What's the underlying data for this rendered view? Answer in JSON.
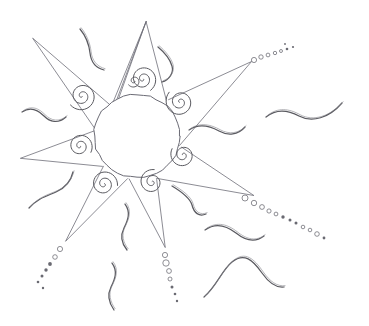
{
  "artwork": {
    "title": "Hand-drawn sun with rays, spirals and squiggles",
    "medium": "pencil sketch",
    "canvas": {
      "width": 369,
      "height": 326,
      "background": "#ffffff"
    },
    "palette": {
      "line": "#6e6e78",
      "spiral": "#59595f",
      "squiggle": "#5a5a60",
      "dot": "#6a6a72",
      "background": "#ffffff"
    }
  },
  "core": {
    "label": "sun-core",
    "cx": 137,
    "cy": 136,
    "r": 43,
    "stroke": "#6b6b75"
  },
  "rays": [
    {
      "name": "ray-north",
      "tip_x": 146,
      "tip_y": 21,
      "base_a_x": 117,
      "base_a_y": 103,
      "base_b_x": 166,
      "base_b_y": 100,
      "has_trail": false
    },
    {
      "name": "ray-northeast",
      "tip_x": 252,
      "tip_y": 61,
      "base_a_x": 168,
      "base_a_y": 99,
      "base_b_x": 180,
      "base_b_y": 146,
      "has_trail": true
    },
    {
      "name": "ray-east",
      "tip_x": 254,
      "tip_y": 196,
      "base_a_x": 181,
      "base_a_y": 148,
      "base_b_x": 157,
      "base_b_y": 178,
      "has_trail": true
    },
    {
      "name": "ray-south",
      "tip_x": 165,
      "tip_y": 248,
      "base_a_x": 156,
      "base_a_y": 179,
      "base_b_x": 129,
      "base_b_y": 179,
      "has_trail": true
    },
    {
      "name": "ray-southwest",
      "tip_x": 66,
      "tip_y": 241,
      "base_a_x": 128,
      "base_a_y": 178,
      "base_b_x": 104,
      "base_b_y": 167,
      "has_trail": true
    },
    {
      "name": "ray-west",
      "tip_x": 20,
      "tip_y": 158,
      "base_a_x": 102,
      "base_a_y": 166,
      "base_b_x": 95,
      "base_b_y": 130,
      "has_trail": false
    },
    {
      "name": "ray-northwest",
      "tip_x": 33,
      "tip_y": 38,
      "base_a_x": 95,
      "base_a_y": 128,
      "base_b_x": 110,
      "base_b_y": 105,
      "has_trail": false
    },
    {
      "name": "ray-north-left",
      "tip_x": 146,
      "tip_y": 21,
      "base_a_x": 112,
      "base_a_y": 104,
      "base_b_x": 116,
      "base_b_y": 103,
      "has_trail": false
    }
  ],
  "spirals": [
    {
      "name": "spiral-ray-north",
      "cx": 143,
      "cy": 79,
      "r": 13,
      "turns": 2.1,
      "rotation": 20
    },
    {
      "name": "spiral-ray-northeast",
      "cx": 180,
      "cy": 102,
      "r": 14,
      "turns": 2.2,
      "rotation": 150
    },
    {
      "name": "spiral-ray-east",
      "cx": 183,
      "cy": 155,
      "r": 12,
      "turns": 2.0,
      "rotation": 210
    },
    {
      "name": "spiral-ray-south",
      "cx": 152,
      "cy": 182,
      "r": 12,
      "turns": 2.0,
      "rotation": 280
    },
    {
      "name": "spiral-ray-southwest",
      "cx": 104,
      "cy": 184,
      "r": 13,
      "turns": 2.1,
      "rotation": 330
    },
    {
      "name": "spiral-ray-west",
      "cx": 80,
      "cy": 146,
      "r": 12,
      "turns": 2.0,
      "rotation": 30
    },
    {
      "name": "spiral-ray-northwest",
      "cx": 82,
      "cy": 96,
      "r": 14,
      "turns": 2.2,
      "rotation": 70
    },
    {
      "name": "spiral-ray-upper",
      "cx": 134,
      "cy": 81,
      "r": 6,
      "turns": 1.4,
      "rotation": 0
    }
  ],
  "trails": [
    {
      "name": "trail-northeast",
      "from_ray": "ray-northeast",
      "dots": [
        {
          "x": 254,
          "y": 60,
          "r": 2.6,
          "filled": false
        },
        {
          "x": 261,
          "y": 57,
          "r": 2.2,
          "filled": false
        },
        {
          "x": 268,
          "y": 55,
          "r": 1.9,
          "filled": false
        },
        {
          "x": 275,
          "y": 53,
          "r": 1.7,
          "filled": false
        },
        {
          "x": 281,
          "y": 51,
          "r": 1.5,
          "filled": false
        },
        {
          "x": 287,
          "y": 49,
          "r": 1.3,
          "filled": true
        },
        {
          "x": 293,
          "y": 47,
          "r": 1.1,
          "filled": true
        },
        {
          "x": 285,
          "y": 44,
          "r": 0.9,
          "filled": true
        }
      ]
    },
    {
      "name": "trail-east",
      "from_ray": "ray-east",
      "dots": [
        {
          "x": 245,
          "y": 198,
          "r": 3.0,
          "filled": false
        },
        {
          "x": 254,
          "y": 203,
          "r": 2.7,
          "filled": false
        },
        {
          "x": 262,
          "y": 207,
          "r": 2.4,
          "filled": false
        },
        {
          "x": 269,
          "y": 211,
          "r": 2.1,
          "filled": false
        },
        {
          "x": 276,
          "y": 214,
          "r": 1.9,
          "filled": false
        },
        {
          "x": 283,
          "y": 217,
          "r": 1.7,
          "filled": true
        },
        {
          "x": 290,
          "y": 220,
          "r": 1.5,
          "filled": true
        },
        {
          "x": 296,
          "y": 223,
          "r": 1.5,
          "filled": true
        },
        {
          "x": 303,
          "y": 227,
          "r": 1.8,
          "filled": false
        },
        {
          "x": 310,
          "y": 230,
          "r": 1.8,
          "filled": false
        },
        {
          "x": 317,
          "y": 234,
          "r": 2.3,
          "filled": false
        },
        {
          "x": 324,
          "y": 238,
          "r": 1.4,
          "filled": true
        }
      ]
    },
    {
      "name": "trail-south",
      "from_ray": "ray-south",
      "dots": [
        {
          "x": 165,
          "y": 255,
          "r": 2.6,
          "filled": false
        },
        {
          "x": 166,
          "y": 263,
          "r": 3.2,
          "filled": false
        },
        {
          "x": 169,
          "y": 271,
          "r": 2.4,
          "filled": false
        },
        {
          "x": 170,
          "y": 279,
          "r": 2.0,
          "filled": false
        },
        {
          "x": 172,
          "y": 287,
          "r": 1.5,
          "filled": true
        },
        {
          "x": 175,
          "y": 294,
          "r": 1.3,
          "filled": true
        },
        {
          "x": 177,
          "y": 301,
          "r": 1.2,
          "filled": true
        }
      ]
    },
    {
      "name": "trail-southwest",
      "from_ray": "ray-southwest",
      "dots": [
        {
          "x": 60,
          "y": 249,
          "r": 2.6,
          "filled": false
        },
        {
          "x": 55,
          "y": 257,
          "r": 2.3,
          "filled": false
        },
        {
          "x": 50,
          "y": 264,
          "r": 1.9,
          "filled": true
        },
        {
          "x": 46,
          "y": 270,
          "r": 1.7,
          "filled": true
        },
        {
          "x": 42,
          "y": 276,
          "r": 1.5,
          "filled": true
        },
        {
          "x": 38,
          "y": 282,
          "r": 1.3,
          "filled": true
        },
        {
          "x": 43,
          "y": 288,
          "r": 1.2,
          "filled": true
        }
      ]
    }
  ],
  "squiggles": [
    {
      "name": "squiggle-top-left",
      "path": "M 80,29 C 85,35 89,44 90,53 C 91,62 96,68 104,70",
      "style": "double"
    },
    {
      "name": "squiggle-top-right",
      "path": "M 158,47 C 164,52 170,59 172,66 C 174,73 169,80 162,82",
      "style": "double"
    },
    {
      "name": "squiggle-left-upper",
      "path": "M 22,112 C 31,106 38,110 44,116 C 50,122 58,124 66,117",
      "style": "double"
    },
    {
      "name": "squiggle-right-mid",
      "path": "M 189,130 C 199,123 210,126 219,131 C 228,136 238,135 245,127",
      "style": "double"
    },
    {
      "name": "squiggle-far-right",
      "path": "M 266,117 C 277,108 288,110 299,116 C 312,123 329,118 342,103",
      "style": "double"
    },
    {
      "name": "squiggle-left-lower",
      "path": "M 29,208 C 38,198 47,196 56,192 C 65,188 71,181 73,172",
      "style": "double"
    },
    {
      "name": "squiggle-bottom-mid",
      "path": "M 172,186 C 182,192 190,198 192,205 C 194,213 199,217 206,214",
      "style": "double"
    },
    {
      "name": "squiggle-vert-upper",
      "path": "M 125,204 C 131,212 128,220 124,228 C 120,236 122,244 127,250",
      "style": "double"
    },
    {
      "name": "squiggle-vert-lower",
      "path": "M 112,263 C 118,271 115,279 111,287 C 107,295 109,303 114,310",
      "style": "double"
    },
    {
      "name": "squiggle-bottom-right",
      "path": "M 205,230 C 216,222 227,226 236,233 C 246,241 255,243 264,236",
      "style": "double"
    },
    {
      "name": "squiggle-lower-right",
      "path": "M 204,297 C 216,287 222,270 232,262 C 244,252 253,260 262,273 C 269,283 276,288 284,287",
      "style": "double"
    }
  ]
}
